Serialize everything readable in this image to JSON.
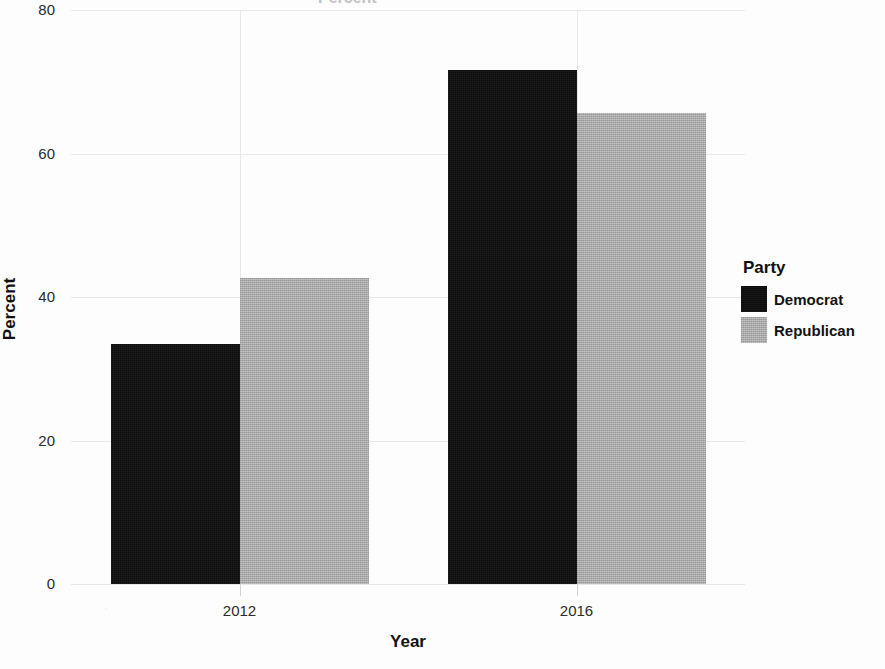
{
  "chart_data": {
    "type": "bar",
    "title": "",
    "xlabel": "Year",
    "ylabel": "Percent",
    "categories": [
      "2012",
      "2016"
    ],
    "series": [
      {
        "name": "Democrat",
        "color": "#0d0d0d",
        "values": [
          33.5,
          71.6
        ]
      },
      {
        "name": "Republican",
        "color": "#a8a8a8",
        "values": [
          42.6,
          65.7
        ]
      }
    ],
    "ylim": [
      0,
      80
    ],
    "yticks": [
      0,
      20,
      40,
      60,
      80
    ],
    "ytick_labels": [
      "0",
      "20",
      "40",
      "60",
      "80"
    ],
    "grid": "both",
    "legend_position": "right"
  },
  "legend": {
    "title": "Party",
    "entries": [
      {
        "label": "Democrat",
        "swatch": "black-swatch"
      },
      {
        "label": "Republican",
        "swatch": "gray-swatch"
      }
    ]
  },
  "axes": {
    "x_label": "Year",
    "y_label": "Percent",
    "x_ticks": [
      "2012",
      "2016"
    ],
    "y_ticks": [
      "0",
      "20",
      "40",
      "60",
      "80"
    ]
  },
  "title_ghost": "Percent"
}
